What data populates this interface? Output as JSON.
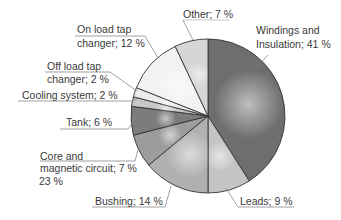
{
  "chart_data": {
    "type": "pie",
    "title": "",
    "start_angle_deg": 0,
    "direction": "clockwise",
    "categories": [
      "Windings and Insulation",
      "Leads",
      "Bushing",
      "Core and magnetic circuit",
      "Tank",
      "Cooling system",
      "Off load tap changer",
      "On load tap changer",
      "Other"
    ],
    "values": [
      41,
      9,
      14,
      7,
      6,
      2,
      2,
      12,
      7
    ],
    "unit": "%",
    "colors": [
      "#6e6e6e",
      "#c4c4c4",
      "#b0b0b0",
      "#9c9c9c",
      "#7c7c7c",
      "#c8c8c8",
      "#ececec",
      "#f2f2f2",
      "#d6d6d6"
    ],
    "stray_annotation": "23 %"
  },
  "labels": {
    "windings_l1": "Windings and",
    "windings_l2": "Insulation; 41 %",
    "leads": "Leads; 9 %",
    "bushing": "Bushing; 14 %",
    "core_l1": "Core and",
    "core_l2": "magnetic circuit; 7 %",
    "core_l3": "23 %",
    "tank": "Tank; 6 %",
    "cooling": "Cooling system; 2 %",
    "offload_l1": "Off load tap",
    "offload_l2": "changer; 2 %",
    "onload_l1": "On load tap",
    "onload_l2": "changer; 12 %",
    "other": "Other; 7 %"
  }
}
